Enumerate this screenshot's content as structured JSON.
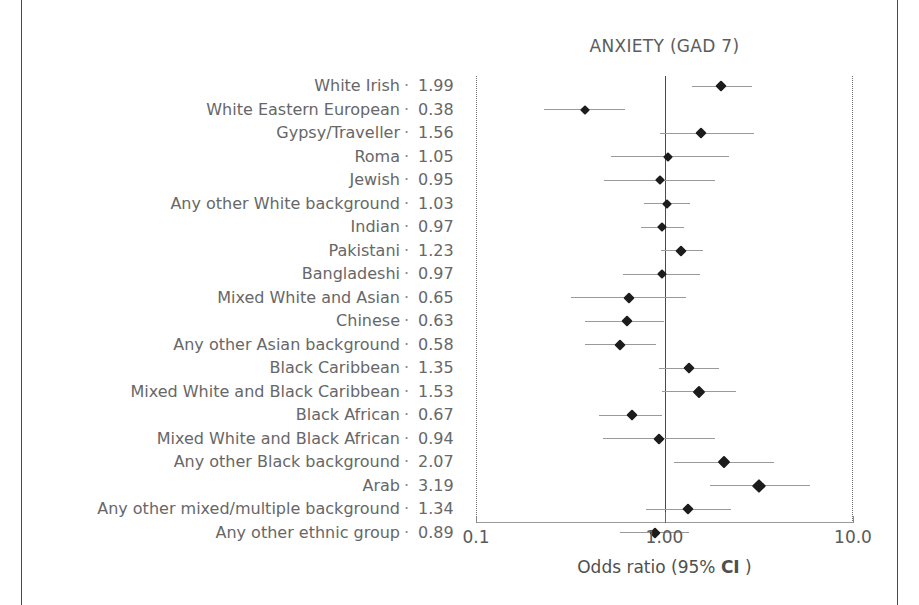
{
  "chart_data": {
    "type": "scatter",
    "plot_style": "forest-plot",
    "title": "ANXIETY (GAD 7)",
    "xlabel": "Odds ratio (95% CI )",
    "xlabel_parts": {
      "before": "Odds ratio (95% ",
      "bold": "CI",
      "after": " )"
    },
    "ylabel": "",
    "xscale": "log",
    "xlim": [
      0.1,
      10.0
    ],
    "xticks": [
      0.1,
      1.0,
      10.0
    ],
    "xtick_labels": [
      "0.1",
      "1.00",
      "10.0"
    ],
    "reference_line": 1.0,
    "grid": false,
    "legend": "none",
    "value_column_header": "",
    "categories": [
      "White Irish",
      "White Eastern European",
      "Gypsy/Traveller",
      "Roma",
      "Jewish",
      "Any other White background",
      "Indian",
      "Pakistani",
      "Bangladeshi",
      "Mixed White and Asian",
      "Chinese",
      "Any other Asian background",
      "Black Caribbean",
      "Mixed White and Black Caribbean",
      "Black African",
      "Mixed White and Black African",
      "Any other Black background",
      "Arab",
      "Any other mixed/multiple background",
      "Any other ethnic group"
    ],
    "values": [
      1.99,
      0.38,
      1.56,
      1.05,
      0.95,
      1.03,
      0.97,
      1.23,
      0.97,
      0.65,
      0.63,
      0.58,
      1.35,
      1.53,
      0.67,
      0.94,
      2.07,
      3.19,
      1.34,
      0.89
    ],
    "ci_low": [
      1.4,
      0.23,
      0.95,
      0.52,
      0.48,
      0.78,
      0.75,
      0.96,
      0.6,
      0.32,
      0.38,
      0.38,
      0.93,
      0.97,
      0.45,
      0.47,
      1.12,
      1.75,
      0.8,
      0.58
    ],
    "ci_high": [
      2.9,
      0.62,
      3.0,
      2.2,
      1.85,
      1.37,
      1.27,
      1.6,
      1.55,
      1.3,
      1.0,
      0.9,
      1.95,
      2.4,
      0.97,
      1.85,
      3.8,
      5.9,
      2.25,
      1.35
    ],
    "marker_size": [
      8,
      7,
      8,
      7,
      7,
      7,
      7,
      8,
      7,
      8,
      8,
      8,
      8,
      9,
      8,
      8,
      9,
      10,
      8,
      8
    ],
    "label_separator": "·"
  }
}
